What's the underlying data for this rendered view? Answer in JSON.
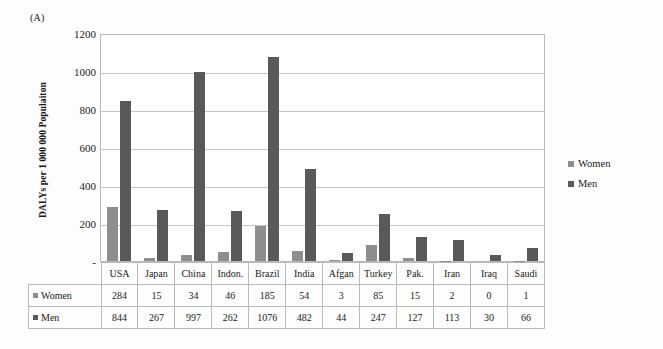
{
  "panel_label": "(A)",
  "legend": {
    "position": "right",
    "entries": [
      {
        "label": "Women",
        "color": "#8e8e8e",
        "marker": "square-swatch-icon"
      },
      {
        "label": "Men",
        "color": "#595959",
        "marker": "square-swatch-icon"
      }
    ]
  },
  "axis": {
    "y_title": "DALYs per 1 000 000 Populaiton",
    "y_ticks": [
      "1200",
      "1000",
      "800",
      "600",
      "400",
      "200",
      "-"
    ]
  },
  "table": {
    "corner_label": "",
    "row_labels": [
      "Women",
      "Men"
    ]
  },
  "chart_data": {
    "type": "bar",
    "title": "",
    "subtitle": "",
    "xlabel": "",
    "ylabel": "DALYs per 1 000 000 Populaiton",
    "ylim": [
      0,
      1200
    ],
    "ytick_values": [
      0,
      200,
      400,
      600,
      800,
      1000,
      1200
    ],
    "ytick_labels": [
      "-",
      "200",
      "400",
      "600",
      "800",
      "1000",
      "1200"
    ],
    "grid": true,
    "legend_position": "right",
    "annotations": [
      "(A)"
    ],
    "categories": [
      "USA",
      "Japan",
      "China",
      "Indon.",
      "Brazil",
      "India",
      "Afgan",
      "Turkey",
      "Pak.",
      "Iran",
      "Iraq",
      "Saudi"
    ],
    "series": [
      {
        "name": "Women",
        "color": "#8e8e8e",
        "values": [
          284,
          15,
          34,
          46,
          185,
          54,
          3,
          85,
          15,
          2,
          0,
          1
        ]
      },
      {
        "name": "Men",
        "color": "#595959",
        "values": [
          844,
          267,
          997,
          262,
          1076,
          482,
          44,
          247,
          127,
          113,
          30,
          66
        ]
      }
    ]
  }
}
